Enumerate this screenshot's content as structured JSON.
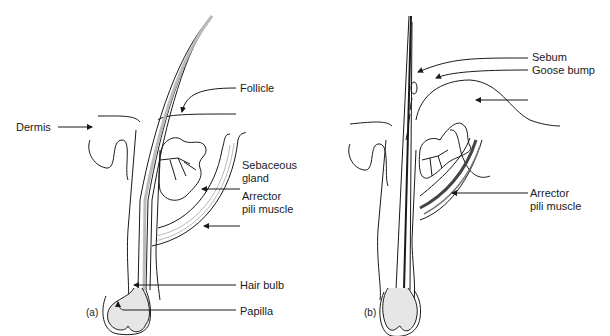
{
  "figure": {
    "panels": [
      {
        "id": "a",
        "panel_label": "(a)",
        "labels": {
          "follicle": "Follicle",
          "dermis": "Dermis",
          "sebaceous_line1": "Sebaceous",
          "sebaceous_line2": "gland",
          "arrector_line1": "Arrector",
          "arrector_line2": "pili muscle",
          "hair_bulb": "Hair bulb",
          "papilla": "Papilla"
        }
      },
      {
        "id": "b",
        "panel_label": "(b)",
        "labels": {
          "sebum": "Sebum",
          "goose_bump": "Goose bump",
          "arrector_line1": "Arrector",
          "arrector_line2": "pili muscle"
        }
      }
    ],
    "colors": {
      "ink": "#1a1a1a",
      "shading": "#dcdcdc",
      "background": "#ffffff"
    }
  }
}
